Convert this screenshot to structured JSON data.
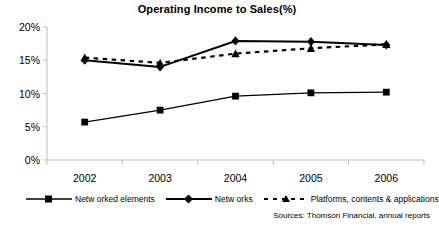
{
  "chart_data": {
    "type": "line",
    "title_main": "Operating Income to Sales",
    "title_suffix": "(%)",
    "xlabel": "",
    "ylabel": "",
    "categories": [
      "2002",
      "2003",
      "2004",
      "2005",
      "2006"
    ],
    "ylim": [
      0,
      20
    ],
    "ytick_labels": [
      "0%",
      "5%",
      "10%",
      "15%",
      "20%"
    ],
    "ytick_values": [
      0,
      5,
      10,
      15,
      20
    ],
    "grid": false,
    "legend_position": "bottom",
    "series": [
      {
        "name": "Networked elements",
        "values": [
          5.7,
          7.5,
          9.6,
          10.1,
          10.2
        ],
        "marker": "square",
        "line_style": "solid",
        "color": "#000000"
      },
      {
        "name": "Networks",
        "values": [
          15.0,
          14.0,
          17.9,
          17.8,
          17.3
        ],
        "marker": "diamond",
        "line_style": "solid",
        "color": "#000000"
      },
      {
        "name": "Platforms, contents & applications",
        "values": [
          15.4,
          14.6,
          16.0,
          16.8,
          17.4
        ],
        "marker": "triangle",
        "line_style": "dashed",
        "color": "#000000"
      }
    ],
    "annotations": [
      "Sources: Thomson Financial, annual reports"
    ]
  },
  "legend": {
    "items": [
      {
        "label": "Netw orked elements",
        "marker": "square",
        "line_style": "solid"
      },
      {
        "label": "Netw orks",
        "marker": "diamond",
        "line_style": "solid"
      },
      {
        "label": "Platforms, contents & applications",
        "marker": "triangle",
        "line_style": "dashed"
      }
    ]
  },
  "source": {
    "text": "Sources: Thomson Financial, annual reports"
  },
  "colors": {
    "series": "#000000",
    "axis": "#bdbdbd",
    "background": "#ffffff"
  }
}
